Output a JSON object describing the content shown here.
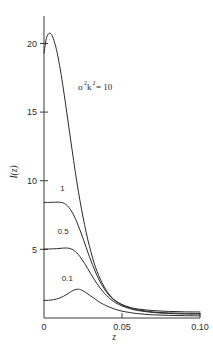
{
  "chart_data": {
    "type": "line",
    "title": "",
    "xlabel": "z",
    "ylabel": "I(z)",
    "xlim": [
      0,
      0.1
    ],
    "ylim": [
      0,
      22
    ],
    "grid": false,
    "legend_position": "inline-curve-labels",
    "xticks": [
      {
        "value": 0,
        "label": "0"
      },
      {
        "value": 0.05,
        "label": "0.05"
      },
      {
        "value": 0.1,
        "label": "0.10"
      }
    ],
    "yticks": [
      {
        "value": 5,
        "label": "5"
      },
      {
        "value": 10,
        "label": "10"
      },
      {
        "value": 15,
        "label": "15"
      },
      {
        "value": 20,
        "label": "20"
      }
    ],
    "annotations": [
      {
        "text_base": "σ",
        "sup1": "2",
        "text_mid": "k",
        "sup2": "2",
        "text_tail": "= 10",
        "full_text": "σ²k² = 10",
        "x": 0.0285,
        "y": 15.8
      }
    ],
    "series": [
      {
        "name": "10",
        "label": "σ²k² = 10",
        "curve_label": "",
        "label_x": 0.0285,
        "label_y": 15.8,
        "points": [
          [
            0.0,
            19.3
          ],
          [
            0.0015,
            20.35
          ],
          [
            0.003,
            20.72
          ],
          [
            0.0045,
            20.7
          ],
          [
            0.006,
            20.35
          ],
          [
            0.008,
            19.55
          ],
          [
            0.01,
            18.4
          ],
          [
            0.012,
            17.0
          ],
          [
            0.014,
            15.45
          ],
          [
            0.016,
            13.85
          ],
          [
            0.018,
            12.25
          ],
          [
            0.02,
            10.7
          ],
          [
            0.022,
            9.25
          ],
          [
            0.024,
            7.95
          ],
          [
            0.026,
            6.8
          ],
          [
            0.028,
            5.75
          ],
          [
            0.03,
            4.85
          ],
          [
            0.032,
            4.05
          ],
          [
            0.034,
            3.4
          ],
          [
            0.036,
            2.85
          ],
          [
            0.038,
            2.4
          ],
          [
            0.04,
            2.0
          ],
          [
            0.043,
            1.55
          ],
          [
            0.046,
            1.25
          ],
          [
            0.05,
            0.98
          ],
          [
            0.055,
            0.78
          ],
          [
            0.06,
            0.66
          ],
          [
            0.07,
            0.54
          ],
          [
            0.08,
            0.48
          ],
          [
            0.09,
            0.45
          ],
          [
            0.1,
            0.44
          ]
        ]
      },
      {
        "name": "1",
        "label": "1",
        "curve_label": "1",
        "label_x": 0.0118,
        "label_y": 9.25,
        "points": [
          [
            0.0,
            8.42
          ],
          [
            0.003,
            8.42
          ],
          [
            0.006,
            8.43
          ],
          [
            0.009,
            8.44
          ],
          [
            0.011,
            8.42
          ],
          [
            0.013,
            8.35
          ],
          [
            0.015,
            8.18
          ],
          [
            0.017,
            7.9
          ],
          [
            0.019,
            7.5
          ],
          [
            0.021,
            7.0
          ],
          [
            0.023,
            6.42
          ],
          [
            0.025,
            5.8
          ],
          [
            0.027,
            5.15
          ],
          [
            0.029,
            4.5
          ],
          [
            0.031,
            3.9
          ],
          [
            0.033,
            3.35
          ],
          [
            0.035,
            2.85
          ],
          [
            0.037,
            2.42
          ],
          [
            0.04,
            1.9
          ],
          [
            0.043,
            1.5
          ],
          [
            0.046,
            1.22
          ],
          [
            0.05,
            0.96
          ],
          [
            0.055,
            0.74
          ],
          [
            0.06,
            0.6
          ],
          [
            0.07,
            0.44
          ],
          [
            0.08,
            0.37
          ],
          [
            0.09,
            0.34
          ],
          [
            0.1,
            0.33
          ]
        ]
      },
      {
        "name": "0.5",
        "label": "0.5",
        "curve_label": "0.5",
        "label_x": 0.0122,
        "label_y": 6.1,
        "points": [
          [
            0.0,
            5.02
          ],
          [
            0.004,
            5.03
          ],
          [
            0.008,
            5.05
          ],
          [
            0.011,
            5.08
          ],
          [
            0.014,
            5.1
          ],
          [
            0.016,
            5.08
          ],
          [
            0.018,
            5.0
          ],
          [
            0.02,
            4.85
          ],
          [
            0.022,
            4.62
          ],
          [
            0.024,
            4.32
          ],
          [
            0.026,
            3.98
          ],
          [
            0.028,
            3.6
          ],
          [
            0.03,
            3.22
          ],
          [
            0.032,
            2.85
          ],
          [
            0.034,
            2.5
          ],
          [
            0.036,
            2.18
          ],
          [
            0.038,
            1.9
          ],
          [
            0.04,
            1.65
          ],
          [
            0.043,
            1.34
          ],
          [
            0.046,
            1.1
          ],
          [
            0.05,
            0.88
          ],
          [
            0.055,
            0.68
          ],
          [
            0.06,
            0.55
          ],
          [
            0.07,
            0.4
          ],
          [
            0.08,
            0.33
          ],
          [
            0.09,
            0.29
          ],
          [
            0.1,
            0.28
          ]
        ]
      },
      {
        "name": "0.1",
        "label": "0.1",
        "curve_label": "0.1",
        "label_x": 0.015,
        "label_y": 2.7,
        "points": [
          [
            0.0,
            1.28
          ],
          [
            0.004,
            1.3
          ],
          [
            0.008,
            1.38
          ],
          [
            0.011,
            1.5
          ],
          [
            0.014,
            1.68
          ],
          [
            0.0165,
            1.86
          ],
          [
            0.0185,
            2.0
          ],
          [
            0.0205,
            2.08
          ],
          [
            0.022,
            2.1
          ],
          [
            0.0235,
            2.06
          ],
          [
            0.025,
            1.98
          ],
          [
            0.027,
            1.84
          ],
          [
            0.029,
            1.68
          ],
          [
            0.031,
            1.52
          ],
          [
            0.033,
            1.36
          ],
          [
            0.035,
            1.2
          ],
          [
            0.038,
            1.0
          ],
          [
            0.041,
            0.84
          ],
          [
            0.045,
            0.66
          ],
          [
            0.05,
            0.5
          ],
          [
            0.055,
            0.4
          ],
          [
            0.06,
            0.32
          ],
          [
            0.07,
            0.23
          ],
          [
            0.08,
            0.19
          ],
          [
            0.09,
            0.17
          ],
          [
            0.1,
            0.16
          ]
        ]
      }
    ]
  },
  "figure": {
    "caption": ""
  }
}
